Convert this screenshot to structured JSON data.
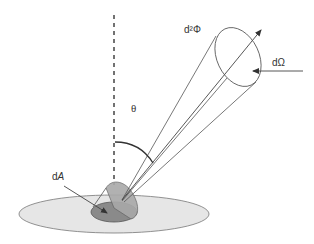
{
  "figure": {
    "labels": {
      "flux": "d²Φ",
      "solid_angle": "dΩ",
      "angle": "θ",
      "area_prefix": "d",
      "area_var": "A"
    },
    "colors": {
      "stroke": "#555555",
      "surface_fill": "#e6e6e6",
      "area_fill": "#8a8a8a",
      "tilted_disc_fill": "#a9a9a9",
      "text": "#333333"
    }
  }
}
